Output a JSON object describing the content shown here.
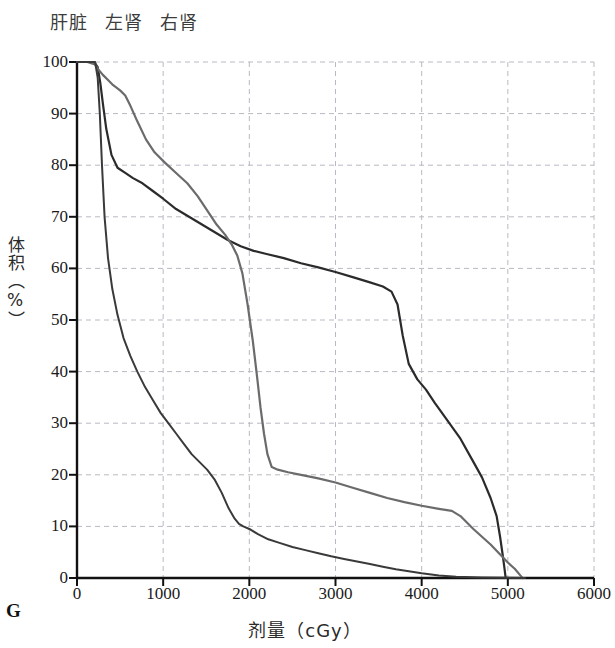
{
  "legend": {
    "position": "top-left",
    "items": [
      {
        "label": "肝脏",
        "color": "#2b2b2b"
      },
      {
        "label": "左肾",
        "color": "#6b6b6b"
      },
      {
        "label": "右肾",
        "color": "#3a3a3a"
      }
    ]
  },
  "panel": {
    "label": "G"
  },
  "axes": {
    "x_title": "剂量（cGy）",
    "y_title": "体积（%）",
    "x_ticks": [
      "0",
      "1000",
      "2000",
      "3000",
      "4000",
      "5000",
      "6000"
    ],
    "y_ticks": [
      "0",
      "10",
      "20",
      "30",
      "40",
      "50",
      "60",
      "70",
      "80",
      "90",
      "100"
    ]
  },
  "chart_data": {
    "type": "line",
    "title": "",
    "subtitle": "",
    "xlabel": "剂量（cGy）",
    "ylabel": "体积（%）",
    "xlim": [
      0,
      6000
    ],
    "ylim": [
      0,
      100
    ],
    "xticks": [
      0,
      1000,
      2000,
      3000,
      4000,
      5000,
      6000
    ],
    "yticks": [
      0,
      10,
      20,
      30,
      40,
      50,
      60,
      70,
      80,
      90,
      100
    ],
    "grid": true,
    "grid_style": "dashed",
    "legend_position": "top-left",
    "annotations": [
      "G"
    ],
    "series": [
      {
        "name": "肝脏",
        "name_en": "Liver",
        "color": "#2b2b2b",
        "width": 2.2,
        "x": [
          0,
          120,
          200,
          240,
          270,
          300,
          340,
          400,
          470,
          560,
          650,
          760,
          880,
          1000,
          1150,
          1300,
          1450,
          1600,
          1750,
          1900,
          2050,
          2200,
          2400,
          2600,
          2800,
          3000,
          3200,
          3400,
          3550,
          3650,
          3720,
          3780,
          3850,
          3950,
          4050,
          4150,
          4300,
          4450,
          4600,
          4700,
          4800,
          4870,
          4910,
          4940,
          4960,
          4975
        ],
        "y": [
          100,
          100,
          100,
          99,
          96,
          92,
          87,
          82,
          79.5,
          78.5,
          77.5,
          76.5,
          75,
          73.5,
          71.5,
          70,
          68.5,
          67,
          65.5,
          64.3,
          63.4,
          62.8,
          62,
          61,
          60.2,
          59.3,
          58.3,
          57.3,
          56.5,
          55.5,
          53,
          47,
          41.5,
          38.5,
          36.5,
          34,
          30.5,
          27,
          22.5,
          19.5,
          15.5,
          12,
          8,
          4.5,
          2,
          0
        ]
      },
      {
        "name": "左肾",
        "name_en": "Left kidney",
        "color": "#6b6b6b",
        "width": 2.2,
        "x": [
          0,
          120,
          210,
          250,
          300,
          360,
          420,
          500,
          560,
          620,
          700,
          800,
          900,
          1020,
          1150,
          1280,
          1400,
          1520,
          1620,
          1720,
          1800,
          1860,
          1920,
          1980,
          2040,
          2090,
          2130,
          2170,
          2210,
          2260,
          2330,
          2450,
          2600,
          2800,
          3000,
          3200,
          3400,
          3600,
          3800,
          4000,
          4200,
          4350,
          4450,
          4600,
          4800,
          5000,
          5080,
          5140,
          5170
        ],
        "y": [
          100,
          100,
          99.5,
          98.5,
          97.5,
          96.5,
          95.5,
          94.5,
          93.5,
          91.5,
          88.5,
          85,
          82.5,
          80.5,
          78.5,
          76.5,
          74,
          71,
          68.5,
          66.5,
          64.5,
          62.5,
          59,
          53,
          46,
          39,
          33,
          28,
          24,
          21.5,
          21,
          20.5,
          20,
          19.3,
          18.5,
          17.5,
          16.5,
          15.5,
          14.7,
          14,
          13.4,
          13,
          12,
          9.5,
          6.5,
          3,
          1.8,
          0.6,
          0
        ]
      },
      {
        "name": "右肾",
        "name_en": "Right kidney",
        "color": "#3a3a3a",
        "width": 2.0,
        "x": [
          0,
          120,
          210,
          240,
          265,
          290,
          320,
          360,
          410,
          470,
          540,
          620,
          700,
          790,
          880,
          970,
          1060,
          1150,
          1240,
          1330,
          1420,
          1510,
          1600,
          1680,
          1760,
          1830,
          1880,
          1930,
          2000,
          2100,
          2220,
          2350,
          2500,
          2650,
          2800,
          2950,
          3100,
          3250,
          3400,
          3550,
          3700,
          3850,
          4000,
          4200,
          4400,
          4700,
          5000,
          5200
        ],
        "y": [
          100,
          100,
          100,
          97,
          90,
          80,
          70,
          62,
          56,
          51,
          46.5,
          43,
          40,
          37,
          34.5,
          32,
          30,
          28,
          26,
          24,
          22.5,
          21,
          19,
          16.5,
          13.5,
          11.5,
          10.5,
          10,
          9.5,
          8.5,
          7.5,
          6.8,
          6,
          5.4,
          4.8,
          4.2,
          3.7,
          3.2,
          2.7,
          2.2,
          1.7,
          1.3,
          0.9,
          0.5,
          0.25,
          0.1,
          0.05,
          0
        ]
      }
    ]
  },
  "colors": {
    "axis": "#111111",
    "grid": "#b9b9c4",
    "background": "#ffffff"
  }
}
